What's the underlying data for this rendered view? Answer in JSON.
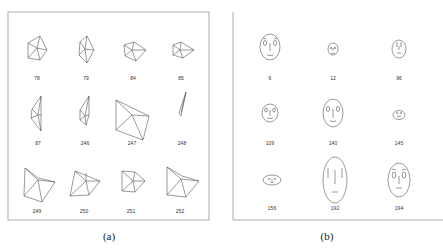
{
  "figure": {
    "panels": [
      {
        "caption": "(a)",
        "type": "star-glyph-plot",
        "labels": [
          "78",
          "79",
          "84",
          "85",
          "87",
          "246",
          "247",
          "248",
          "249",
          "250",
          "251",
          "252"
        ]
      },
      {
        "caption": "(b)",
        "type": "chernoff-faces",
        "labels": [
          "6",
          "12",
          "96",
          "109",
          "140",
          "145",
          "156",
          "192",
          "194"
        ]
      }
    ]
  }
}
